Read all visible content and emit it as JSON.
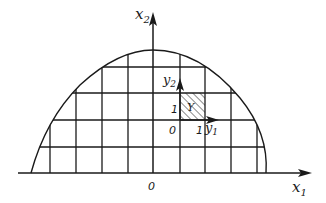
{
  "figure": {
    "axes": {
      "x1": {
        "label": "x",
        "sub": "1"
      },
      "x2": {
        "label": "x",
        "sub": "2"
      },
      "origin_label": "0"
    },
    "local_cell": {
      "y1": {
        "label": "y",
        "sub": "1"
      },
      "y2": {
        "label": "y",
        "sub": "2"
      },
      "origin_label": "0",
      "tick_y1": "1",
      "tick_y2": "1",
      "cell_label": "Y"
    },
    "colors": {
      "stroke": "#1a1a1a",
      "background": "#ffffff"
    }
  }
}
